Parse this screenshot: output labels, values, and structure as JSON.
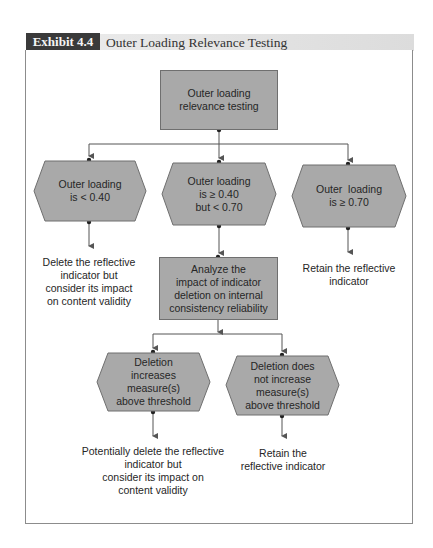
{
  "header": {
    "label": "Exhibit 4.4",
    "title": "Outer Loading Relevance Testing"
  },
  "colors": {
    "node_fill": "#a9a9a9",
    "node_border": "#6f6f6f",
    "header_label_bg": "#3a3a3a",
    "header_title_bg": "#e2e2e2",
    "connector": "#555555"
  },
  "nodes": {
    "start": {
      "lines": [
        "Outer loading",
        "relevance testing"
      ]
    },
    "cond_low": {
      "lines": [
        "Outer loading",
        "is < 0.40"
      ]
    },
    "cond_mid": {
      "lines": [
        "Outer loading",
        "is ≥ 0.40",
        "but < 0.70"
      ]
    },
    "cond_high": {
      "lines": [
        "Outer  loading",
        "is ≥ 0.70"
      ]
    },
    "outcome_low": {
      "lines": [
        "Delete the reflective",
        "indicator but",
        "consider its impact",
        "on content validity"
      ]
    },
    "outcome_high": {
      "lines": [
        "Retain the reflective",
        "indicator"
      ]
    },
    "analyze": {
      "lines": [
        "Analyze the",
        "impact of indicator",
        "deletion on internal",
        "consistency reliability"
      ]
    },
    "cond_increase": {
      "lines": [
        "Deletion",
        "increases",
        "measure(s)",
        "above threshold"
      ]
    },
    "cond_no_increase": {
      "lines": [
        "Deletion does",
        "not increase",
        "measure(s)",
        "above threshold"
      ]
    },
    "outcome_increase": {
      "lines": [
        "Potentially delete the reflective",
        "indicator but",
        "consider its impact on",
        "content validity"
      ]
    },
    "outcome_no_increase": {
      "lines": [
        "Retain the",
        "reflective indicator"
      ]
    }
  }
}
